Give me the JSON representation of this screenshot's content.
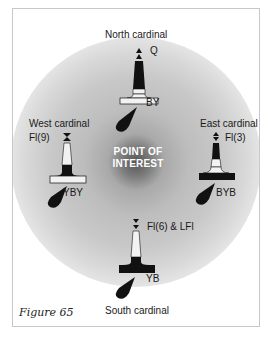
{
  "diagram": {
    "center_label_line1": "POINT OF",
    "center_label_line2": "INTEREST",
    "caption": "Figure 65",
    "marks": {
      "north": {
        "title": "North cardinal",
        "light": "Q",
        "colours": "BY",
        "topmark": "two cones pointing up"
      },
      "east": {
        "title": "East cardinal",
        "light": "Fl(3)",
        "colours": "BYB",
        "topmark": "two cones base to base"
      },
      "south": {
        "title": "South cardinal",
        "light": "Fl(6) & LFl",
        "colours": "YB",
        "topmark": "two cones pointing down"
      },
      "west": {
        "title": "West cardinal",
        "light": "Fl(9)",
        "colours": "YBY",
        "topmark": "two cones point to point"
      }
    },
    "colors": {
      "black": "#111111",
      "yellow_rendered": "#f2f2f2",
      "halo_core": "#555555"
    }
  }
}
